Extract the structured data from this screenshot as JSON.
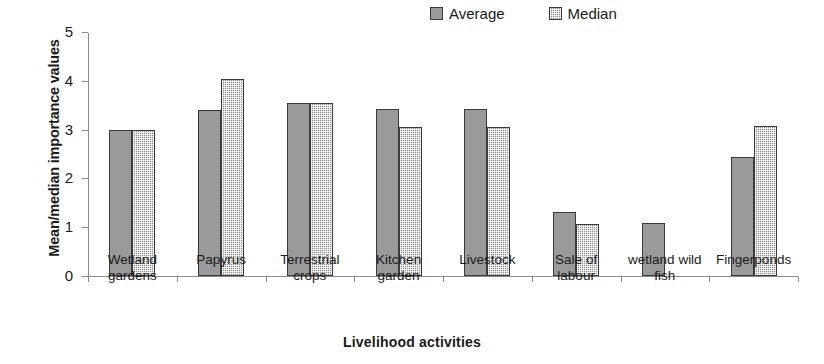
{
  "chart_data": {
    "type": "bar",
    "title": "",
    "xlabel": "Livelihood activities",
    "ylabel": "Mean/median importance values",
    "ylim": [
      0,
      5
    ],
    "yticks": [
      0,
      1,
      2,
      3,
      4,
      5
    ],
    "grid": false,
    "legend_position": "top-right-inside",
    "categories": [
      "Wetland gardens",
      "Papyrus",
      "Terrestrial crops",
      "Kitchen garden",
      "Livestock",
      "Sale of labour",
      "wetland wild fish",
      "Fingerponds"
    ],
    "category_lines": [
      [
        "Wetland",
        "gardens"
      ],
      [
        "Papyrus"
      ],
      [
        "Terrestrial",
        "crops"
      ],
      [
        "Kitchen",
        "garden"
      ],
      [
        "Livestock"
      ],
      [
        "Sale of",
        "labour"
      ],
      [
        "wetland wild",
        "fish"
      ],
      [
        "Fingerponds"
      ]
    ],
    "series": [
      {
        "name": "Average",
        "values": [
          3.0,
          3.4,
          3.55,
          3.42,
          3.42,
          1.32,
          1.08,
          2.44
        ]
      },
      {
        "name": "Median",
        "values": [
          3.0,
          4.03,
          3.55,
          3.05,
          3.05,
          1.07,
          null,
          3.08
        ]
      }
    ]
  },
  "colors": {
    "average_fill": "#9a9a9a",
    "median_fill": "#8f8f8f",
    "bar_border": "#3a3a3a",
    "axis": "#8a8a8a",
    "text": "#1a1a1a",
    "background": "#ffffff"
  }
}
